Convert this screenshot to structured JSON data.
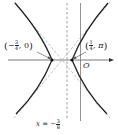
{
  "diagram": {
    "type": "hyperbola-plot",
    "colors": {
      "curve": "#222222",
      "asymptote": "#888888",
      "axis": "#555555",
      "dashed_line": "#777777",
      "background": "#ffffff"
    },
    "axes": {
      "origin_label": "O"
    },
    "vertices": [
      {
        "name": "left-vertex",
        "label_open": "(",
        "label_sign": "−",
        "label_num": "3",
        "label_den": "4",
        "label_rest": ", 0",
        "label_close": ")"
      },
      {
        "name": "right-vertex",
        "label_open": "(",
        "label_sign": "",
        "label_num": "1",
        "label_den": "4",
        "label_rest": ", π",
        "label_close": ")"
      }
    ],
    "directrix": {
      "label_prefix": "x = −",
      "label_num": "3",
      "label_den": "8"
    }
  }
}
